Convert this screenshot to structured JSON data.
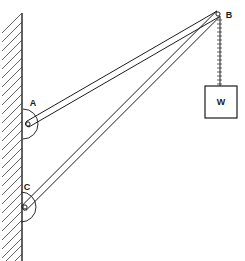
{
  "figure": {
    "width": 245,
    "height": 261,
    "background_color": "#ffffff",
    "line_color": "#1c1c1c"
  },
  "labels": {
    "point_a": "A",
    "point_b": "B",
    "point_c": "C",
    "weight": "W"
  },
  "geometry": {
    "wall": {
      "x": 22,
      "top_y": 14,
      "bottom_y": 261,
      "hatch_width": 20,
      "hatch_count": 26
    },
    "points": {
      "A": {
        "x": 28,
        "y": 124
      },
      "B": {
        "x": 218,
        "y": 14
      },
      "C": {
        "x": 25,
        "y": 207
      }
    },
    "members": [
      {
        "name": "member-ab",
        "from": "A",
        "to": "B",
        "thickness": 4
      },
      {
        "name": "member-cb",
        "from": "C",
        "to": "B",
        "thickness": 4
      }
    ],
    "angle_arcs": [
      {
        "name": "angle-arc-a",
        "at": "A",
        "radius": 15
      },
      {
        "name": "angle-arc-c",
        "at": "C",
        "radius": 15
      }
    ],
    "cable": {
      "x": 220,
      "top_y": 16,
      "bottom_y": 86,
      "rung_count": 18
    },
    "weight_box": {
      "x": 205,
      "y": 86,
      "width": 32,
      "height": 32
    }
  },
  "label_positions": {
    "A": {
      "x": 33,
      "y": 106
    },
    "B": {
      "x": 229,
      "y": 17
    },
    "C": {
      "x": 27,
      "y": 190
    },
    "W": {
      "x": 221,
      "y": 105
    }
  }
}
